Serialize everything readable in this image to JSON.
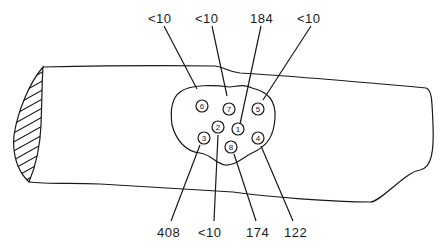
{
  "figure": {
    "top_labels": [
      {
        "site": "6",
        "value": "<10"
      },
      {
        "site": "7",
        "value": "<10"
      },
      {
        "site": "1",
        "value": "184"
      },
      {
        "site": "5",
        "value": "<10"
      }
    ],
    "bottom_labels": [
      {
        "site": "3",
        "value": "408"
      },
      {
        "site": "2",
        "value": "<10"
      },
      {
        "site": "8",
        "value": "174"
      },
      {
        "site": "4",
        "value": "122"
      }
    ],
    "sites": [
      {
        "id": "1",
        "label": "1",
        "value": "184"
      },
      {
        "id": "2",
        "label": "2",
        "value": "<10"
      },
      {
        "id": "3",
        "label": "3",
        "value": "408"
      },
      {
        "id": "4",
        "label": "4",
        "value": "122"
      },
      {
        "id": "5",
        "label": "5",
        "value": "<10"
      },
      {
        "id": "6",
        "label": "6",
        "value": "<10"
      },
      {
        "id": "7",
        "label": "7",
        "value": "<10"
      },
      {
        "id": "8",
        "label": "8",
        "value": "174"
      }
    ],
    "colors": {
      "line": "#1a1a1a",
      "background": "#ffffff"
    }
  }
}
